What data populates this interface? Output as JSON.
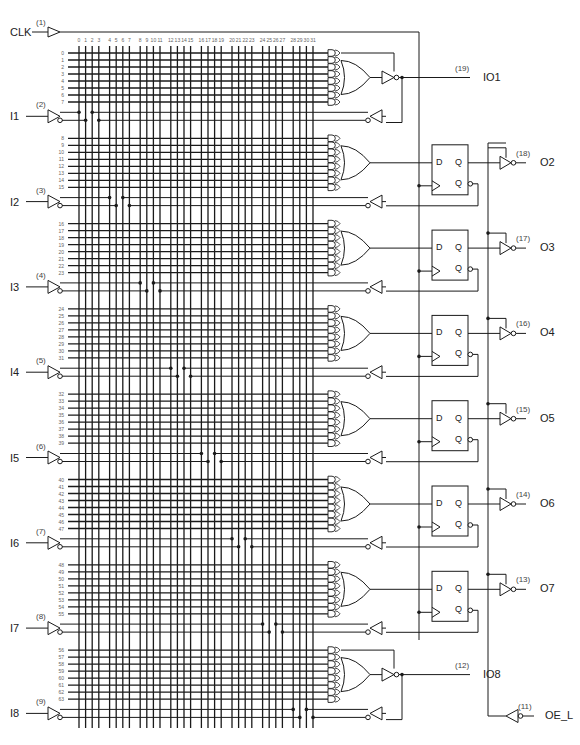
{
  "diagram": {
    "clock": {
      "label": "CLK",
      "pin": "(1)"
    },
    "inputs": [
      {
        "label": "I1",
        "pin": "(2)"
      },
      {
        "label": "I2",
        "pin": "(3)"
      },
      {
        "label": "I3",
        "pin": "(4)"
      },
      {
        "label": "I4",
        "pin": "(5)"
      },
      {
        "label": "I5",
        "pin": "(6)"
      },
      {
        "label": "I6",
        "pin": "(7)"
      },
      {
        "label": "I7",
        "pin": "(8)"
      },
      {
        "label": "I8",
        "pin": "(9)"
      }
    ],
    "outputs": [
      {
        "label": "IO1",
        "pin": "(19)",
        "type": "combinational-io"
      },
      {
        "label": "O2",
        "pin": "(18)",
        "type": "registered"
      },
      {
        "label": "O3",
        "pin": "(17)",
        "type": "registered"
      },
      {
        "label": "O4",
        "pin": "(16)",
        "type": "registered"
      },
      {
        "label": "O5",
        "pin": "(15)",
        "type": "registered"
      },
      {
        "label": "O6",
        "pin": "(14)",
        "type": "registered"
      },
      {
        "label": "O7",
        "pin": "(13)",
        "type": "registered"
      },
      {
        "label": "IO8",
        "pin": "(12)",
        "type": "combinational-io"
      }
    ],
    "output_enable": {
      "label": "OE_L",
      "pin": "(11)"
    },
    "flipflop": {
      "d": "D",
      "q": "Q",
      "qn": "Q"
    },
    "columns": [
      "0",
      "1",
      "2",
      "3",
      "4",
      "5",
      "6",
      "7",
      "8",
      "9",
      "10",
      "11",
      "12",
      "13",
      "14",
      "15",
      "16",
      "17",
      "18",
      "19",
      "20",
      "21",
      "22",
      "23",
      "24",
      "25",
      "26",
      "27",
      "28",
      "29",
      "30",
      "31"
    ],
    "product_terms": 64,
    "terms_per_output": 8
  }
}
